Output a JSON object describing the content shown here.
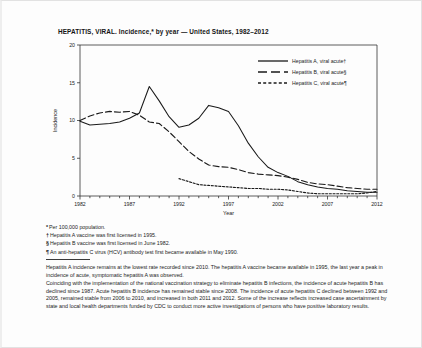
{
  "figure": {
    "title": "HEPATITIS, VIRAL. Incidence,* by year — United States, 1982–2012"
  },
  "legend": [
    {
      "label": "Hepatitis A, viral acute†",
      "style": "solid",
      "color": "#1a1a1a"
    },
    {
      "label": "Hepatitis B, viral acute§",
      "style": "dashed",
      "color": "#1a1a1a"
    },
    {
      "label": "Hepatitis C, viral acute¶",
      "style": "dotted",
      "color": "#1a1a1a"
    }
  ],
  "footnotes": [
    {
      "mark": "*",
      "text": "Per 100,000 population."
    },
    {
      "mark": "†",
      "text": "Hepatitis A vaccine was first licensed in 1995."
    },
    {
      "mark": "§",
      "text": "Hepatitis B vaccine was first licensed in June 1982."
    },
    {
      "mark": "¶",
      "text": "An anti-hepatitis C virus (HCV) antibody test first became available in May 1990."
    }
  ],
  "body": {
    "paragraphs": [
      "Hepatitis A incidence remains at the lowest rate recorded since 2010. The hepatitis A vaccine became available in 1995, the last year a peak in incidence of acute, symptomatic hepatitis A was observed.",
      "Coinciding with the implementation of the national vaccination strategy to eliminate hepatitis B infections, the incidence of acute hepatitis B has declined since 1987.  Acute hepatitis B incidence has remained stable since 2008. The incidence of acute hepatitis C declined between 1992 and 2005, remained stable from 2006 to 2010, and increased in both 2011 and 2012.  Some of the increase reflects increased case ascertainment by state and local health departments funded by CDC to conduct more active investigations of persons who have positive laboratory results."
    ]
  },
  "chart_data": {
    "type": "line",
    "title": "HEPATITIS, VIRAL. Incidence,* by year — United States, 1982–2012",
    "xlabel": "Year",
    "ylabel": "Incidence",
    "xlim": [
      1982,
      2012
    ],
    "ylim": [
      0,
      20
    ],
    "yticks": [
      0,
      5,
      10,
      15,
      20
    ],
    "xticks": [
      1982,
      1987,
      1992,
      1997,
      2002,
      2007,
      2012
    ],
    "grid": false,
    "legend_position": "top-right",
    "x": [
      1982,
      1983,
      1984,
      1985,
      1986,
      1987,
      1988,
      1989,
      1990,
      1991,
      1992,
      1993,
      1994,
      1995,
      1996,
      1997,
      1998,
      1999,
      2000,
      2001,
      2002,
      2003,
      2004,
      2005,
      2006,
      2007,
      2008,
      2009,
      2010,
      2011,
      2012
    ],
    "series": [
      {
        "name": "Hepatitis A, viral acute†",
        "style": "solid",
        "values": [
          9.9,
          9.4,
          9.5,
          9.6,
          9.8,
          10.3,
          11.0,
          14.5,
          12.6,
          10.5,
          9.1,
          9.4,
          10.3,
          12.0,
          11.7,
          11.2,
          9.3,
          7.0,
          5.2,
          3.8,
          3.1,
          2.6,
          1.9,
          1.5,
          1.2,
          1.0,
          0.9,
          0.7,
          0.6,
          0.5,
          0.5
        ]
      },
      {
        "name": "Hepatitis B, viral acute§",
        "style": "dashed",
        "values": [
          10.0,
          10.6,
          11.0,
          11.2,
          11.1,
          11.2,
          10.7,
          9.8,
          9.6,
          8.5,
          7.2,
          5.9,
          4.9,
          4.1,
          3.9,
          3.8,
          3.5,
          3.1,
          2.9,
          2.8,
          2.7,
          2.5,
          2.2,
          1.8,
          1.6,
          1.5,
          1.3,
          1.1,
          1.0,
          0.9,
          0.9
        ]
      },
      {
        "name": "Hepatitis C, viral acute¶",
        "style": "dotted",
        "values": [
          null,
          null,
          null,
          null,
          null,
          null,
          null,
          null,
          null,
          null,
          2.3,
          1.9,
          1.5,
          1.4,
          1.3,
          1.2,
          1.1,
          1.0,
          1.0,
          0.9,
          0.9,
          0.8,
          0.6,
          0.4,
          0.3,
          0.3,
          0.3,
          0.3,
          0.3,
          0.4,
          0.6
        ]
      }
    ]
  }
}
